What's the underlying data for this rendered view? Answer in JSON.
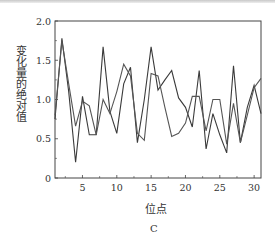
{
  "chart_data": {
    "type": "line",
    "title": "",
    "caption": "C",
    "xlabel": "位点",
    "ylabel": "变化量的绝对值",
    "xlim": [
      1,
      31
    ],
    "ylim": [
      0,
      2.0
    ],
    "x_ticks": [
      5,
      10,
      15,
      20,
      25,
      30
    ],
    "y_ticks": [
      0,
      0.5,
      1.0,
      1.5,
      2.0
    ],
    "y_tick_labels": [
      "0",
      "0.5",
      "1.0",
      "1.5",
      "2.0"
    ],
    "grid": false,
    "legend": null,
    "x": [
      1,
      2,
      3,
      4,
      5,
      6,
      7,
      8,
      9,
      10,
      11,
      12,
      13,
      14,
      15,
      16,
      17,
      18,
      19,
      20,
      21,
      22,
      23,
      24,
      25,
      26,
      27,
      28,
      29,
      30,
      31
    ],
    "series": [
      {
        "name": "series-1",
        "color": "#3a3a3a",
        "values": [
          0.75,
          1.78,
          1.1,
          0.2,
          1.04,
          0.55,
          0.55,
          1.67,
          0.85,
          0.57,
          1.2,
          1.41,
          0.45,
          1.0,
          1.67,
          1.12,
          1.25,
          1.37,
          1.02,
          0.9,
          0.65,
          1.37,
          0.37,
          0.82,
          0.55,
          0.32,
          1.43,
          0.45,
          0.9,
          1.18,
          0.82
        ]
      },
      {
        "name": "series-2",
        "color": "#555555",
        "values": [
          0.8,
          1.75,
          1.2,
          0.66,
          0.98,
          0.92,
          0.55,
          1.0,
          0.82,
          1.1,
          1.45,
          1.3,
          0.57,
          0.48,
          1.33,
          1.3,
          0.9,
          0.53,
          0.57,
          0.7,
          1.04,
          1.04,
          0.6,
          1.0,
          1.0,
          0.43,
          0.95,
          0.45,
          0.8,
          1.15,
          1.27
        ]
      }
    ]
  },
  "labels": {
    "xlabel": "位点",
    "ylabel": "变化量的绝对值",
    "caption": "C"
  }
}
